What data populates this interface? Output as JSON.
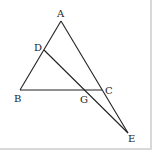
{
  "diagram": {
    "type": "geometry",
    "points": {
      "A": {
        "label": "A",
        "x": 61,
        "y": 21
      },
      "B": {
        "label": "B",
        "x": 20,
        "y": 90
      },
      "C": {
        "label": "C",
        "x": 102,
        "y": 90
      },
      "D": {
        "label": "D",
        "x": 44,
        "y": 50
      },
      "G": {
        "label": "G",
        "x": 86,
        "y": 90
      },
      "E": {
        "label": "E",
        "x": 128,
        "y": 133
      }
    },
    "segments": [
      [
        "A",
        "B"
      ],
      [
        "B",
        "C"
      ],
      [
        "A",
        "E"
      ],
      [
        "D",
        "E"
      ]
    ],
    "stroke_color": "#222222"
  }
}
